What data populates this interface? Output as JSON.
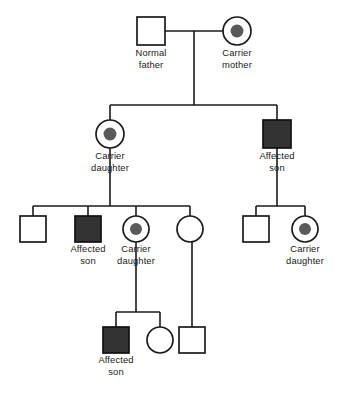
{
  "figure": {
    "kind": "pedigree-chart",
    "title": "",
    "background_color": "#ffffff",
    "line_color": "#1a1a1a",
    "affected_fill_color": "#333333",
    "carrier_dot_color": "#5a5a5a",
    "open_fill_color": "#ffffff",
    "width": 339,
    "height": 396
  },
  "legend_terms": {
    "normal": "Normal",
    "carrier": "Carrier",
    "affected": "Affected",
    "male": "son",
    "father": "father",
    "female": "daughter",
    "mother": "mother"
  },
  "generations": [
    {
      "id": "I",
      "members": [
        {
          "id": "I-1",
          "sex": "male",
          "shape": "square",
          "status": "normal",
          "fill": "open",
          "cx": 151,
          "cy": 31,
          "size": 28,
          "label_lines": [
            "Normal",
            "father"
          ],
          "label_y": 56
        },
        {
          "id": "I-2",
          "sex": "female",
          "shape": "circle",
          "status": "carrier",
          "fill": "carrier",
          "cx": 237,
          "cy": 31,
          "size": 28,
          "label_lines": [
            "Carrier",
            "mother"
          ],
          "label_y": 56
        }
      ]
    },
    {
      "id": "II",
      "members": [
        {
          "id": "II-1",
          "sex": "female",
          "shape": "circle",
          "status": "carrier",
          "fill": "carrier",
          "cx": 110,
          "cy": 134,
          "size": 28,
          "label_lines": [
            "Carrier",
            "daughter"
          ],
          "label_y": 159
        },
        {
          "id": "II-2",
          "sex": "male",
          "shape": "square",
          "status": "affected",
          "fill": "filled",
          "cx": 277,
          "cy": 134,
          "size": 28,
          "label_lines": [
            "Affected",
            "son"
          ],
          "label_y": 159
        }
      ]
    },
    {
      "id": "III",
      "members": [
        {
          "id": "III-1",
          "sex": "male",
          "shape": "square",
          "status": "normal",
          "fill": "open",
          "cx": 33,
          "cy": 229,
          "size": 26,
          "label_lines": [],
          "label_y": 252
        },
        {
          "id": "III-2",
          "sex": "male",
          "shape": "square",
          "status": "affected",
          "fill": "filled",
          "cx": 88,
          "cy": 229,
          "size": 26,
          "label_lines": [
            "Affected",
            "son"
          ],
          "label_y": 252
        },
        {
          "id": "III-3",
          "sex": "female",
          "shape": "circle",
          "status": "carrier",
          "fill": "carrier",
          "cx": 136,
          "cy": 229,
          "size": 26,
          "label_lines": [
            "Carrier",
            "daughter"
          ],
          "label_y": 252
        },
        {
          "id": "III-4",
          "sex": "female",
          "shape": "circle",
          "status": "normal",
          "fill": "open",
          "cx": 190,
          "cy": 229,
          "size": 26,
          "label_lines": [],
          "label_y": 252
        },
        {
          "id": "III-5",
          "sex": "male",
          "shape": "square",
          "status": "normal",
          "fill": "open",
          "cx": 256,
          "cy": 229,
          "size": 26,
          "label_lines": [],
          "label_y": 252
        },
        {
          "id": "III-6",
          "sex": "female",
          "shape": "circle",
          "status": "carrier",
          "fill": "carrier",
          "cx": 305,
          "cy": 229,
          "size": 26,
          "label_lines": [
            "Carrier",
            "daughter"
          ],
          "label_y": 252
        }
      ]
    },
    {
      "id": "IV",
      "members": [
        {
          "id": "IV-1",
          "sex": "male",
          "shape": "square",
          "status": "affected",
          "fill": "filled",
          "cx": 116,
          "cy": 340,
          "size": 26,
          "label_lines": [
            "Affected",
            "son"
          ],
          "label_y": 363
        },
        {
          "id": "IV-2",
          "sex": "female",
          "shape": "circle",
          "status": "normal",
          "fill": "open",
          "cx": 160,
          "cy": 340,
          "size": 26,
          "label_lines": [],
          "label_y": 363
        },
        {
          "id": "IV-3",
          "sex": "male",
          "shape": "square",
          "status": "normal",
          "fill": "open",
          "cx": 192,
          "cy": 340,
          "size": 26,
          "label_lines": [],
          "label_y": 363
        }
      ]
    }
  ],
  "connectors": {
    "mating_lines": [
      {
        "id": "mating-I",
        "x1": 165,
        "y1": 31,
        "x2": 223,
        "y2": 31
      }
    ],
    "descent_drops": [
      {
        "id": "drop-I-to-sibline",
        "x1": 194,
        "y1": 31,
        "x2": 194,
        "y2": 105
      },
      {
        "id": "drop-II-1-down",
        "x1": 110,
        "y1": 148,
        "x2": 110,
        "y2": 206
      },
      {
        "id": "drop-II-2-down",
        "x1": 277,
        "y1": 148,
        "x2": 277,
        "y2": 206
      },
      {
        "id": "drop-III-3-down",
        "x1": 136,
        "y1": 242,
        "x2": 136,
        "y2": 312
      },
      {
        "id": "drop-III-4-down",
        "x1": 192,
        "y1": 242,
        "x2": 192,
        "y2": 327
      }
    ],
    "sibship_lines": [
      {
        "id": "sibline-II",
        "x1": 110,
        "y1": 105,
        "x2": 277,
        "y2": 105
      },
      {
        "id": "sibline-III-left",
        "x1": 33,
        "y1": 206,
        "x2": 190,
        "y2": 206
      },
      {
        "id": "sibline-III-right",
        "x1": 256,
        "y1": 206,
        "x2": 305,
        "y2": 206
      },
      {
        "id": "sibline-IV",
        "x1": 116,
        "y1": 312,
        "x2": 160,
        "y2": 312
      }
    ],
    "child_stems": [
      {
        "id": "stem-II-1",
        "x1": 110,
        "y1": 105,
        "x2": 110,
        "y2": 120
      },
      {
        "id": "stem-II-2",
        "x1": 277,
        "y1": 105,
        "x2": 277,
        "y2": 120
      },
      {
        "id": "stem-III-1",
        "x1": 33,
        "y1": 206,
        "x2": 33,
        "y2": 216
      },
      {
        "id": "stem-III-2",
        "x1": 88,
        "y1": 206,
        "x2": 88,
        "y2": 216
      },
      {
        "id": "stem-III-3",
        "x1": 136,
        "y1": 206,
        "x2": 136,
        "y2": 216
      },
      {
        "id": "stem-III-4",
        "x1": 190,
        "y1": 206,
        "x2": 190,
        "y2": 216
      },
      {
        "id": "stem-III-5",
        "x1": 256,
        "y1": 206,
        "x2": 256,
        "y2": 216
      },
      {
        "id": "stem-III-6",
        "x1": 305,
        "y1": 206,
        "x2": 305,
        "y2": 216
      },
      {
        "id": "stem-IV-1",
        "x1": 116,
        "y1": 312,
        "x2": 116,
        "y2": 327
      },
      {
        "id": "stem-IV-2",
        "x1": 160,
        "y1": 312,
        "x2": 160,
        "y2": 327
      }
    ]
  },
  "labels": [
    {
      "id": "label-I-1",
      "lines": [
        "Normal",
        "father"
      ],
      "x": 151,
      "y": 56
    },
    {
      "id": "label-I-2",
      "lines": [
        "Carrier",
        "mother"
      ],
      "x": 237,
      "y": 56
    },
    {
      "id": "label-II-1",
      "lines": [
        "Carrier",
        "daughter"
      ],
      "x": 110,
      "y": 159
    },
    {
      "id": "label-II-2",
      "lines": [
        "Affected",
        "son"
      ],
      "x": 277,
      "y": 159
    },
    {
      "id": "label-III-2",
      "lines": [
        "Affected",
        "son"
      ],
      "x": 88,
      "y": 252
    },
    {
      "id": "label-III-3",
      "lines": [
        "Carrier",
        "daughter"
      ],
      "x": 136,
      "y": 252
    },
    {
      "id": "label-III-6",
      "lines": [
        "Carrier",
        "daughter"
      ],
      "x": 305,
      "y": 252
    },
    {
      "id": "label-IV-1",
      "lines": [
        "Affected",
        "son"
      ],
      "x": 116,
      "y": 363
    }
  ]
}
